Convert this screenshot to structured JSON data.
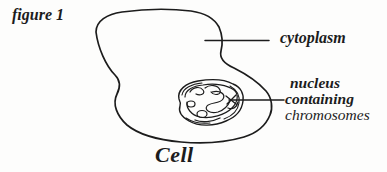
{
  "figure": {
    "label": "figure 1",
    "caption": "Cell"
  },
  "diagram": {
    "labels": {
      "cytoplasm": "cytoplasm",
      "nucleus_line1": "nucleus",
      "nucleus_line2": "containing",
      "nucleus_line3": "chromosomes"
    }
  },
  "colors": {
    "ink": "#1c1c1c",
    "background": "#fdfdfc"
  }
}
